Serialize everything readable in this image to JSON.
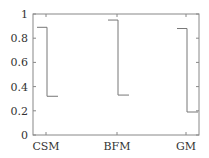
{
  "chart_data": {
    "type": "line",
    "title": "",
    "xlabel": "",
    "ylabel": "",
    "categories": [
      "CSM",
      "BFM",
      "GM"
    ],
    "ylim": [
      0,
      1
    ],
    "yticks": [
      "0",
      "0.2",
      "0.4",
      "0.6",
      "0.8",
      "1"
    ],
    "grid": false,
    "legend": null,
    "series": [
      {
        "name": "CSM",
        "start": 0.89,
        "end": 0.32
      },
      {
        "name": "BFM",
        "start": 0.95,
        "end": 0.33
      },
      {
        "name": "GM",
        "start": 0.88,
        "end": 0.19
      }
    ],
    "style": "step-down bracket per category",
    "line_color": "#777777"
  }
}
